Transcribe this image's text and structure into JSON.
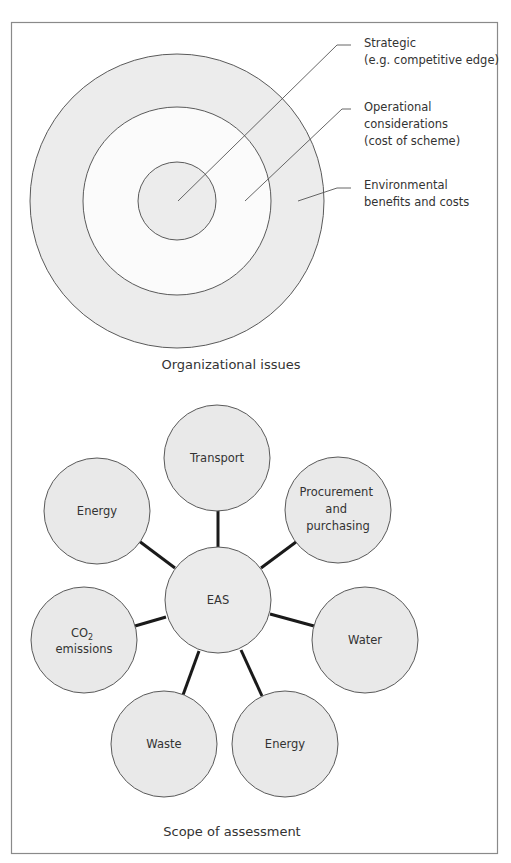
{
  "colors": {
    "frame": "#8a8a8a",
    "ring_fill": "#ececec",
    "ring_stroke": "#5a5a5a",
    "node_fill": "#e9e9e9",
    "node_stroke": "#5a5a5a",
    "connector": "#1a1a1a"
  },
  "organizational": {
    "caption": "Organizational issues",
    "rings": [
      {
        "name": "environmental",
        "label_lines": [
          "Environmental",
          "benefits and costs"
        ]
      },
      {
        "name": "operational",
        "label_lines": [
          "Operational",
          "considerations",
          "(cost of scheme)"
        ]
      },
      {
        "name": "strategic",
        "label_lines": [
          "Strategic",
          "(e.g. competitive edge)"
        ]
      }
    ]
  },
  "scope": {
    "caption": "Scope of assessment",
    "center": {
      "label": "EAS"
    },
    "nodes": [
      {
        "name": "transport",
        "label_lines": [
          "Transport"
        ]
      },
      {
        "name": "procurement",
        "label_lines": [
          "Procurement",
          "and",
          "purchasing"
        ]
      },
      {
        "name": "water",
        "label_lines": [
          "Water"
        ]
      },
      {
        "name": "energy-bottom",
        "label_lines": [
          "Energy"
        ]
      },
      {
        "name": "waste",
        "label_lines": [
          "Waste"
        ]
      },
      {
        "name": "co2",
        "label_main": "CO",
        "label_sub": "2",
        "label_second": "emissions"
      },
      {
        "name": "energy-top",
        "label_lines": [
          "Energy"
        ]
      }
    ]
  }
}
